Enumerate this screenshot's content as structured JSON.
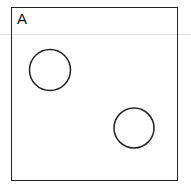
{
  "panel": {
    "label": "A",
    "border_color": "#222222",
    "background": "#ffffff"
  },
  "divider": {
    "color": "#e4e4e4",
    "y": 34
  },
  "circles": [
    {
      "cx": 50,
      "cy": 70,
      "r": 20.5,
      "stroke": "#222222"
    },
    {
      "cx": 134,
      "cy": 128,
      "r": 20,
      "stroke": "#222222"
    }
  ]
}
